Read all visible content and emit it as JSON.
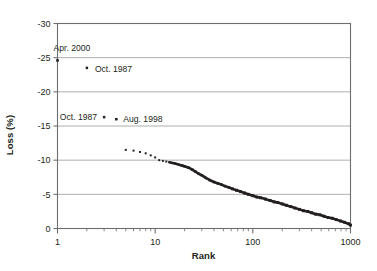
{
  "chart_data": {
    "type": "scatter",
    "title": "",
    "xlabel": "Rank",
    "ylabel": "Loss (%)",
    "xscale": "log",
    "xlim": [
      1,
      1000
    ],
    "ylim": [
      -30,
      0
    ],
    "yticks": [
      "-30",
      "-25",
      "-20",
      "-15",
      "-10",
      "-5",
      "0"
    ],
    "ytick_values": [
      -30,
      -25,
      -20,
      -15,
      -10,
      -5,
      0
    ],
    "xticks": [
      "1",
      "10",
      "100",
      "1000"
    ],
    "xtick_values": [
      1,
      10,
      100,
      1000
    ],
    "grid": "horizontal",
    "legend": "none",
    "marker": "small-square",
    "marker_color": "#231f20",
    "series": [
      {
        "name": "Ranked daily losses",
        "x": [
          1,
          2,
          3,
          4,
          5,
          6,
          7,
          8,
          9,
          10,
          11,
          12,
          13,
          14,
          15,
          16,
          17,
          18,
          19,
          20,
          22,
          24,
          26,
          28,
          30,
          33,
          36,
          40,
          44,
          48,
          52,
          57,
          62,
          68,
          75,
          82,
          90,
          100,
          110,
          120,
          135,
          150,
          165,
          180,
          200,
          220,
          245,
          270,
          300,
          330,
          365,
          400,
          440,
          485,
          535,
          590,
          650,
          715,
          790,
          870,
          950,
          1000
        ],
        "y": [
          -24.6,
          -23.5,
          -16.3,
          -16.0,
          -11.5,
          -11.4,
          -11.2,
          -11.0,
          -10.7,
          -10.4,
          -10.0,
          -9.9,
          -9.8,
          -9.7,
          -9.6,
          -9.5,
          -9.4,
          -9.3,
          -9.2,
          -9.1,
          -8.9,
          -8.6,
          -8.3,
          -8.0,
          -7.8,
          -7.4,
          -7.1,
          -6.8,
          -6.6,
          -6.4,
          -6.2,
          -6.0,
          -5.8,
          -5.6,
          -5.4,
          -5.2,
          -5.0,
          -4.8,
          -4.6,
          -4.5,
          -4.3,
          -4.1,
          -3.9,
          -3.8,
          -3.6,
          -3.4,
          -3.2,
          -3.0,
          -2.8,
          -2.6,
          -2.5,
          -2.3,
          -2.1,
          -2.0,
          -1.8,
          -1.6,
          -1.5,
          -1.3,
          -1.1,
          -0.9,
          -0.7,
          -0.5
        ]
      }
    ],
    "annotations": [
      {
        "label": "Apr. 2000",
        "rank": 1,
        "loss": -24.6,
        "align": "right-of-left",
        "label_dx": -4,
        "label_dy": -9
      },
      {
        "label": "Oct. 1987",
        "rank": 2,
        "loss": -23.5,
        "align": "right",
        "label_dx": 8,
        "label_dy": 4
      },
      {
        "label": "Oct. 1987",
        "rank": 3,
        "loss": -16.3,
        "align": "left",
        "label_dx": -7,
        "label_dy": 3
      },
      {
        "label": "Aug. 1998",
        "rank": 4,
        "loss": -16.0,
        "align": "right",
        "label_dx": 7,
        "label_dy": 3
      }
    ]
  },
  "axes": {
    "y_title": "Loss (%)",
    "x_title": "Rank"
  },
  "colors": {
    "background": "#ffffff",
    "ink": "#231f20",
    "grid": "#9a9a9a",
    "axis": "#6d6e71"
  }
}
